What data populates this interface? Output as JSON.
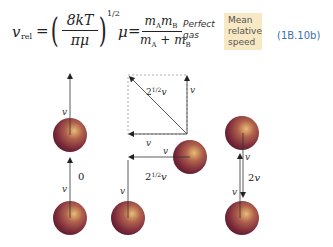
{
  "formula": {
    "vrel_symbol": "v",
    "vrel_subscript": "rel",
    "equals": "=",
    "numerator": "8kT",
    "denominator": "πμ",
    "exponent": "1/2",
    "mu_symbol": "μ",
    "mu_numerator": "mAmB",
    "mu_denominator": "mA + mB"
  },
  "annotation": {
    "condition_line1": "Perfect",
    "condition_line2": "gas",
    "highlight_line1": "Mean",
    "highlight_line2": "relative",
    "highlight_line3": "speed",
    "equation_number": "(1B.10b)",
    "highlight_color": "#f8e8c4",
    "equation_number_color": "#3a6fb0"
  },
  "diagram": {
    "sphere_color": "#7a2a3a",
    "sphere_highlight": "#e8b870",
    "left": {
      "top_velocity_label": "v",
      "bottom_velocity_label": "v",
      "relative_label": "0"
    },
    "middle": {
      "vector_label_top": "v",
      "vector_label_bottom": "v",
      "diagonal_label": "2^{1/2}v",
      "sphere_velocity_label": "v",
      "bottom_velocity_label": "v",
      "relative_label": "2^{1/2}v"
    },
    "right": {
      "top_velocity_label": "v",
      "bottom_velocity_label": "v",
      "relative_label": "2v"
    }
  }
}
